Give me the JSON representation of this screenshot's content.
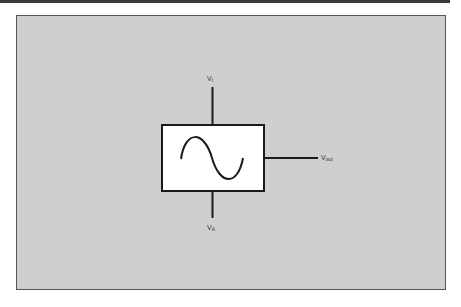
{
  "diagram": {
    "type": "block-diagram",
    "block": {
      "name": "oscillator",
      "symbol": "sine-wave-icon"
    },
    "terminals": {
      "top": {
        "main": "V",
        "sub": "t"
      },
      "bottom": {
        "main": "V",
        "sub": "A"
      },
      "right": {
        "main": "V",
        "sub": "out"
      }
    },
    "colors": {
      "background_panel": "#cfcfcf",
      "block_fill": "#ffffff",
      "stroke": "#1a1a1a"
    }
  }
}
